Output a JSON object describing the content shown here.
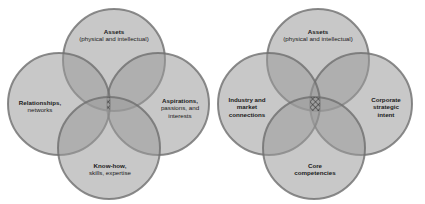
{
  "diagrams": [
    {
      "id": "left",
      "circles": [
        {
          "position": "top",
          "title": "Assets",
          "subtitle": "(physical and intellectual)"
        },
        {
          "position": "left",
          "title": "Relationships,",
          "subtitle": "networks"
        },
        {
          "position": "right",
          "title": "Aspirations,",
          "subtitle": "passions, and",
          "subtitle2": "interests"
        },
        {
          "position": "bottom",
          "title": "Know-how,",
          "subtitle": "skills, expertise"
        }
      ]
    },
    {
      "id": "right",
      "circles": [
        {
          "position": "top",
          "title": "Assets",
          "subtitle": "(physical and intellectual)"
        },
        {
          "position": "left",
          "title": "Industry and",
          "subtitle": "market",
          "subtitle2": "connections"
        },
        {
          "position": "right",
          "title": "Corporate",
          "subtitle": "strategic",
          "subtitle2": "intent"
        },
        {
          "position": "bottom",
          "title": "Core",
          "subtitle": "competencies"
        }
      ]
    }
  ],
  "colors": {
    "circle_fill": "#9a9a9a",
    "circle_stroke": "#6e6e6e",
    "background": "#ffffff",
    "hatch": "#1e1e1e"
  }
}
